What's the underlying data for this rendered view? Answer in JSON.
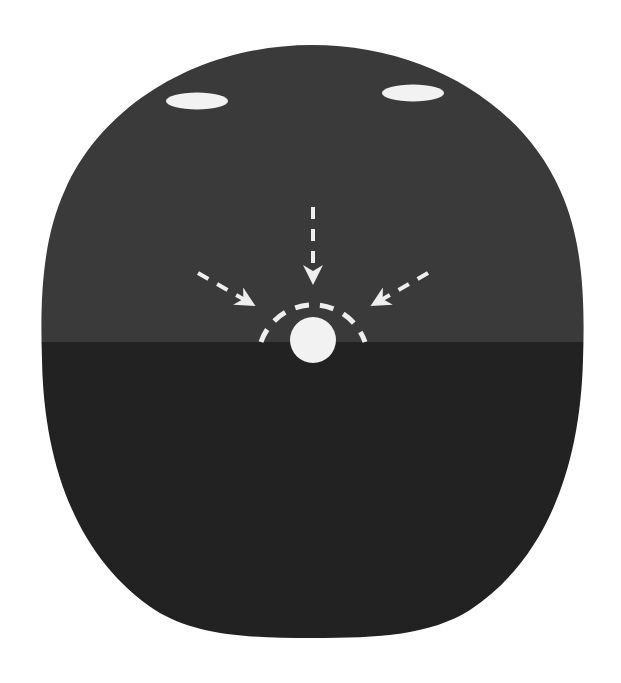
{
  "diagram": {
    "background_color": "#ffffff",
    "head": {
      "upper_color": "#3a3a3a",
      "lower_color": "#222222",
      "split_y": 342,
      "outline": {
        "left": 42,
        "right": 583,
        "top": 45,
        "bottom": 638
      }
    },
    "eyes": [
      {
        "name": "left-eye",
        "cx": 197,
        "cy": 101,
        "rx": 31,
        "ry": 8.5,
        "color": "#f2f2f2"
      },
      {
        "name": "right-eye",
        "cx": 413,
        "cy": 93,
        "rx": 31,
        "ry": 8.5,
        "color": "#f2f2f2"
      }
    ],
    "center_dot": {
      "cx": 313,
      "cy": 340,
      "r": 23,
      "color": "#f2f2f2"
    },
    "dashed_arc": {
      "cx": 313,
      "cy": 345,
      "r": 55,
      "color": "#eeeeee",
      "dash": "14 11"
    },
    "arrows": [
      {
        "name": "arrow-from-top",
        "x1": 313,
        "y1": 207,
        "x2": 313,
        "y2": 283
      },
      {
        "name": "arrow-from-left",
        "x1": 198,
        "y1": 273,
        "x2": 253,
        "y2": 305
      },
      {
        "name": "arrow-from-right",
        "x1": 428,
        "y1": 273,
        "x2": 373,
        "y2": 305
      }
    ],
    "arrow_color": "#eeeeee"
  }
}
